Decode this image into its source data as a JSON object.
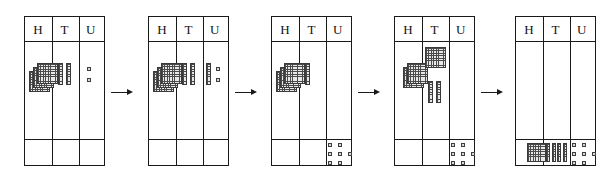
{
  "diagram": {
    "column_headers": [
      "H",
      "T",
      "U"
    ],
    "arrow_glyph": "right-arrow",
    "arrow_count": 4,
    "colors": {
      "ink": "#1a1a1a",
      "block_fill": "#e8e8e8",
      "block_rule": "#4a4a4a",
      "unit_fill": "#d9d9d9"
    },
    "block_legend": {
      "flat": "hundred",
      "rod": "ten",
      "unit": "one"
    }
  },
  "panels": [
    {
      "index": 1,
      "headers": [
        "H",
        "T",
        "U"
      ],
      "work_row": {
        "H": {
          "flats": 3,
          "rods": 0,
          "units": 0
        },
        "T": {
          "flats": 0,
          "rods": 2,
          "units": 0
        },
        "U": {
          "flats": 0,
          "rods": 0,
          "units": 2
        }
      },
      "answer_row": {
        "H": {
          "flats": 0,
          "rods": 0,
          "units": 0
        },
        "T": {
          "flats": 0,
          "rods": 0,
          "units": 0
        },
        "U": {
          "flats": 0,
          "rods": 0,
          "units": 0
        }
      }
    },
    {
      "index": 2,
      "headers": [
        "H",
        "T",
        "U"
      ],
      "work_row": {
        "H": {
          "flats": 3,
          "rods": 0,
          "units": 0
        },
        "T": {
          "flats": 0,
          "rods": 2,
          "units": 0
        },
        "U": {
          "flats": 0,
          "rods": 1,
          "units": 2
        }
      },
      "answer_row": {
        "H": {
          "flats": 0,
          "rods": 0,
          "units": 0
        },
        "T": {
          "flats": 0,
          "rods": 0,
          "units": 0
        },
        "U": {
          "flats": 0,
          "rods": 0,
          "units": 0
        }
      }
    },
    {
      "index": 3,
      "headers": [
        "H",
        "T",
        "U"
      ],
      "work_row": {
        "H": {
          "flats": 3,
          "rods": 0,
          "units": 0
        },
        "T": {
          "flats": 0,
          "rods": 1,
          "units": 0
        },
        "U": {
          "flats": 0,
          "rods": 0,
          "units": 0
        }
      },
      "answer_row": {
        "H": {
          "flats": 0,
          "rods": 0,
          "units": 0
        },
        "T": {
          "flats": 0,
          "rods": 0,
          "units": 0
        },
        "U": {
          "flats": 0,
          "rods": 0,
          "units": 7
        }
      }
    },
    {
      "index": 4,
      "headers": [
        "H",
        "T",
        "U"
      ],
      "work_row": {
        "H": {
          "flats": 2,
          "rods": 0,
          "units": 0
        },
        "T": {
          "flats": 1,
          "rods": 2,
          "units": 0
        },
        "U": {
          "flats": 0,
          "rods": 0,
          "units": 0
        }
      },
      "answer_row": {
        "H": {
          "flats": 0,
          "rods": 0,
          "units": 0
        },
        "T": {
          "flats": 0,
          "rods": 0,
          "units": 0
        },
        "U": {
          "flats": 0,
          "rods": 0,
          "units": 7
        }
      }
    },
    {
      "index": 5,
      "headers": [
        "H",
        "T",
        "U"
      ],
      "work_row": {
        "H": {
          "flats": 0,
          "rods": 0,
          "units": 0
        },
        "T": {
          "flats": 0,
          "rods": 0,
          "units": 0
        },
        "U": {
          "flats": 0,
          "rods": 0,
          "units": 0
        }
      },
      "answer_row": {
        "H": {
          "flats": 1,
          "rods": 0,
          "units": 0
        },
        "T": {
          "flats": 0,
          "rods": 4,
          "units": 0
        },
        "U": {
          "flats": 0,
          "rods": 0,
          "units": 7
        }
      }
    }
  ]
}
